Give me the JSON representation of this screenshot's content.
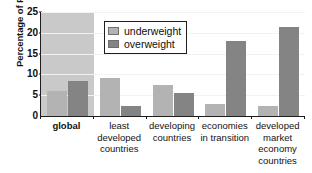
{
  "chart_data": {
    "type": "bar",
    "title": "",
    "xlabel": "",
    "ylabel": "Percentage of Population",
    "ylim": [
      0,
      25
    ],
    "yticks": [
      0,
      5,
      10,
      15,
      20,
      25
    ],
    "grid": true,
    "legend_position": "top-center",
    "categories": [
      "global",
      "least developed countries",
      "developing countries",
      "economies in transition",
      "developed market economy countries"
    ],
    "category_lines": [
      [
        "global"
      ],
      [
        "least",
        "developed",
        "countries"
      ],
      [
        "developing",
        "countries"
      ],
      [
        "economies",
        "in transition"
      ],
      [
        "developed",
        "market",
        "economy",
        "countries"
      ]
    ],
    "highlighted_category": "global",
    "series": [
      {
        "name": "underweight",
        "color": "#b3b3b3",
        "values": [
          6.0,
          9.2,
          7.5,
          3.0,
          2.5
        ]
      },
      {
        "name": "overweight",
        "color": "#848484",
        "values": [
          8.5,
          2.3,
          5.5,
          18.0,
          21.5
        ]
      }
    ]
  },
  "legend": {
    "items": [
      {
        "label": "underweight"
      },
      {
        "label": "overweight"
      }
    ]
  },
  "colors": {
    "underweight": "#b3b3b3",
    "overweight": "#848484",
    "highlight_band": "#c9c9c9",
    "axis": "#1d1d1d",
    "gridline": "#f2f2f2",
    "background": "#ffffff"
  }
}
